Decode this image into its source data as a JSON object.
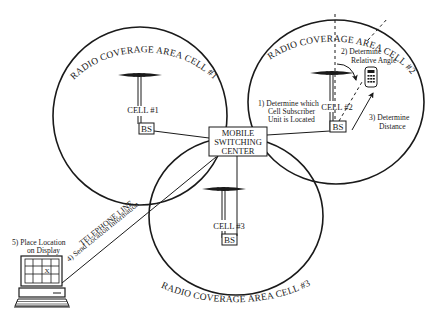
{
  "diagram": {
    "cells": [
      {
        "id": "cell-1",
        "coverage_label": "RADIO COVERAGE AREA CELL #1",
        "cell_label": "CELL #1",
        "base_station_label": "BS"
      },
      {
        "id": "cell-2",
        "coverage_label": "RADIO COVERAGE AREA CELL #2",
        "cell_label": "CELL #2",
        "base_station_label": "BS"
      },
      {
        "id": "cell-3",
        "coverage_label": "RADIO COVERAGE AREA CELL #3",
        "cell_label": "CELL #3",
        "base_station_label": "BS"
      }
    ],
    "msc": {
      "line1": "MOBILE",
      "line2": "SWITCHING",
      "line3": "CENTER"
    },
    "steps": {
      "step1": {
        "line1": "1)  Determine which",
        "line2": "Cell Subscriber",
        "line3": "Unit is Located"
      },
      "step2": {
        "line1": "2)  Determine",
        "line2": "Relative Angle"
      },
      "step3": {
        "line1": "3)  Determine",
        "line2": "Distance"
      },
      "step4": {
        "label": "4)  Send Location Information"
      },
      "step5": {
        "line1": "5)  Place Location",
        "line2": "on Display"
      }
    },
    "telephone_line_label": "TELEPHONE LINE",
    "display_marker": "X",
    "colors": {
      "ink": "#1a1a1a",
      "background": "#ffffff"
    }
  }
}
